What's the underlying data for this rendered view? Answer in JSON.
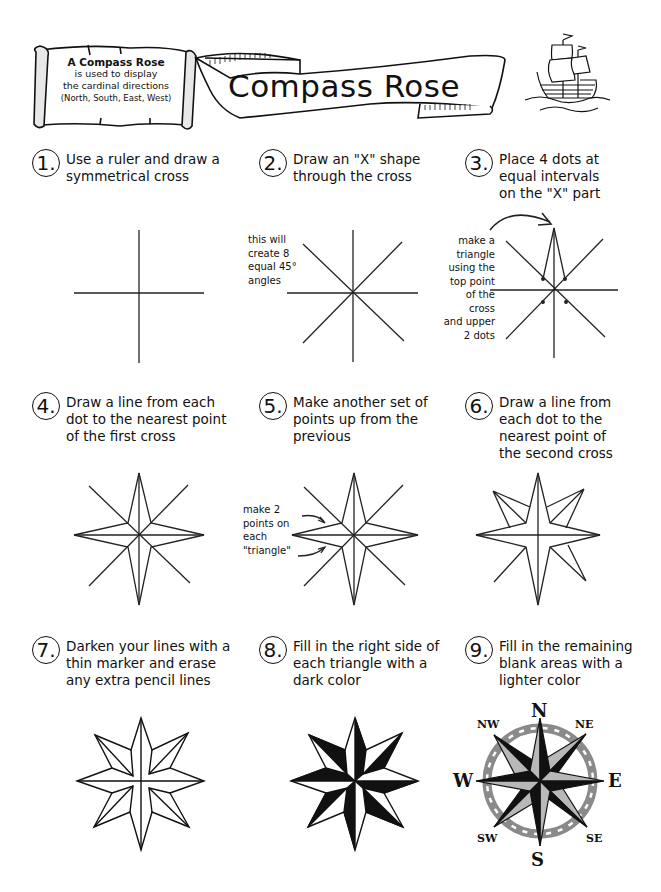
{
  "header": {
    "scroll_note": {
      "line1": "A Compass Rose",
      "line2": "is used to display",
      "line3": "the cardinal directions",
      "line4": "(North, South, East, West)"
    },
    "title": "Compass Rose",
    "ship_icon": "sailing-ship-icon"
  },
  "steps": [
    {
      "number": "1.",
      "lines": [
        "Use a ruler and draw a",
        "symmetrical cross"
      ]
    },
    {
      "number": "2.",
      "lines": [
        "Draw an \"X\" shape",
        "through the cross"
      ],
      "note": [
        "this will",
        "create 8",
        "equal 45°",
        "angles"
      ]
    },
    {
      "number": "3.",
      "lines": [
        "Place 4 dots at",
        "equal intervals",
        "on the \"X\" part"
      ],
      "note": [
        "make a",
        "triangle",
        "using the",
        "top point",
        "of the",
        "cross",
        "and upper",
        "2 dots"
      ]
    },
    {
      "number": "4.",
      "lines": [
        "Draw a line from each",
        "dot to the nearest point",
        "of the first cross"
      ]
    },
    {
      "number": "5.",
      "lines": [
        "Make another set of",
        "points up from the",
        "previous"
      ],
      "note": [
        "make 2",
        "points on",
        "each",
        "\"triangle\""
      ]
    },
    {
      "number": "6.",
      "lines": [
        "Draw a line from",
        "each dot to the",
        "nearest point of",
        "the second cross"
      ]
    },
    {
      "number": "7.",
      "lines": [
        "Darken your lines with a",
        "thin marker and erase",
        "any extra pencil lines"
      ]
    },
    {
      "number": "8.",
      "lines": [
        "Fill in the right side of",
        "each triangle with a",
        "dark color"
      ]
    },
    {
      "number": "9.",
      "lines": [
        "Fill in the remaining",
        "blank areas with a",
        "lighter color"
      ]
    }
  ],
  "compass_labels": {
    "n": "N",
    "ne": "NE",
    "e": "E",
    "se": "SE",
    "s": "S",
    "sw": "SW",
    "w": "W",
    "nw": "NW"
  },
  "colors": {
    "ink": "#111111",
    "ring": "#8a8a8a",
    "light_fill": "#b8b8b8",
    "dark_fill": "#111111"
  }
}
